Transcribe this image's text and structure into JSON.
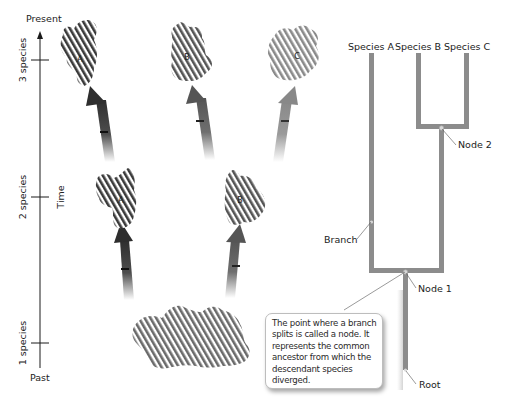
{
  "time_axis": {
    "top_label": "Present",
    "bottom_label": "Past",
    "axis_title": "Time",
    "ticks": [
      {
        "label": "3 species"
      },
      {
        "label": "2 species"
      },
      {
        "label": "1 species"
      }
    ]
  },
  "species_blobs": {
    "present": [
      {
        "label": "A",
        "stripe_color": "#3a3a3a"
      },
      {
        "label": "B",
        "stripe_color": "#555555"
      },
      {
        "label": "C",
        "stripe_color": "#8a8a8a"
      }
    ],
    "middle": [
      {
        "label": "A",
        "stripe_color": "#3a3a3a"
      },
      {
        "label": "B",
        "stripe_color": "#555555"
      }
    ],
    "ancestor": {
      "label": "",
      "stripe_color": "#6a6a6a"
    }
  },
  "cladogram": {
    "tips": [
      "Species A",
      "Species B",
      "Species C"
    ],
    "line_color": "#8c8c8c",
    "labels": {
      "node2": "Node 2",
      "node1": "Node 1",
      "branch": "Branch",
      "root": "Root"
    }
  },
  "callout": {
    "text": "The point where a branch splits is called a node. It represents the common ancestor from which the descendant species diverged."
  },
  "colors": {
    "arrow_dark": "#2e2e2e",
    "arrow_mid": "#555555",
    "arrow_light": "#888888"
  }
}
